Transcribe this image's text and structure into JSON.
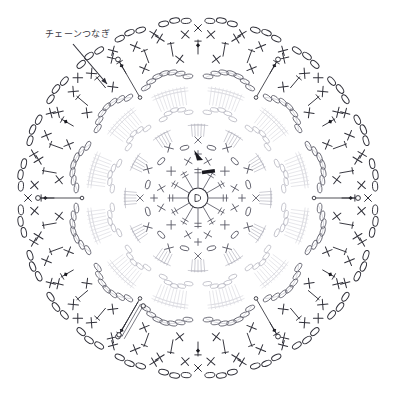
{
  "document": {
    "type": "crochet-pattern-chart",
    "title": "",
    "background_color": "#ffffff"
  },
  "annotations": [
    {
      "id": "chain-join",
      "text": "チェーンつなぎ",
      "x": 45,
      "y": 29,
      "leader_from": [
        73,
        44
      ],
      "leader_to": [
        107,
        84
      ]
    }
  ],
  "colors": {
    "ink_dark": "#2f2f38",
    "ink_mid": "#5a5a66",
    "ink_light": "#b8b8c2",
    "ink_faint": "#d8d8de",
    "marker_fill": "#1a1a20",
    "background": "#ffffff"
  },
  "chart_data": {
    "type": "diagram",
    "title": "",
    "center": [
      198,
      198
    ],
    "symbols_legend": [
      {
        "name": "chain-stitch",
        "glyph": "oval",
        "meaning": "chain (kusari)"
      },
      {
        "name": "single-crochet",
        "glyph": "x",
        "meaning": "single crochet"
      },
      {
        "name": "slip-stitch",
        "glyph": "dot",
        "meaning": "slip stitch"
      },
      {
        "name": "double-crochet",
        "glyph": "t-bar",
        "meaning": "double crochet"
      },
      {
        "name": "treble-crochet",
        "glyph": "t-double-bar",
        "meaning": "treble crochet"
      },
      {
        "name": "picot",
        "glyph": "small-oval-cluster",
        "meaning": "picot"
      },
      {
        "name": "start-marker",
        "glyph": "filled-arrowhead",
        "meaning": "start of round"
      }
    ],
    "rounds": [
      {
        "index": 1,
        "radius": 10,
        "stitch": "ring",
        "count": 1,
        "tone": "ink_dark"
      },
      {
        "index": 2,
        "radius": 30,
        "stitch": "treble-crochet",
        "count": 12,
        "tone": "ink_mid"
      },
      {
        "index": 3,
        "radius": 44,
        "stitch": "single-crochet",
        "count": 12,
        "tone": "ink_mid"
      },
      {
        "index": 4,
        "radius": 58,
        "stitch": "chain-oval",
        "count": 12,
        "tone": "ink_mid"
      },
      {
        "index": 5,
        "radius": 74,
        "stitch": "double-crochet-fan",
        "count": 12,
        "tone": "ink_light"
      },
      {
        "index": 6,
        "radius": 92,
        "stitch": "chain-arc",
        "count": 12,
        "tone": "ink_light"
      },
      {
        "index": 7,
        "radius": 112,
        "stitch": "treble-fan",
        "count": 12,
        "tone": "ink_faint"
      },
      {
        "index": 8,
        "radius": 126,
        "stitch": "chain-arc",
        "count": 12,
        "tone": "ink_mid"
      },
      {
        "index": 9,
        "radius": 140,
        "stitch": "single-crochet",
        "count": 24,
        "tone": "ink_dark"
      },
      {
        "index": 10,
        "radius": 152,
        "stitch": "double-crochet",
        "count": 36,
        "tone": "ink_dark"
      },
      {
        "index": 11,
        "radius": 164,
        "stitch": "single-crochet",
        "count": 40,
        "tone": "ink_dark"
      },
      {
        "index": 12,
        "radius": 176,
        "stitch": "chain-loop",
        "count": 24,
        "tone": "ink_dark"
      }
    ],
    "outer_radius": 180,
    "symmetry": 12,
    "start_marker": {
      "x": 198,
      "y": 158,
      "direction": "down-right"
    },
    "chain_join_connectors": 6
  }
}
